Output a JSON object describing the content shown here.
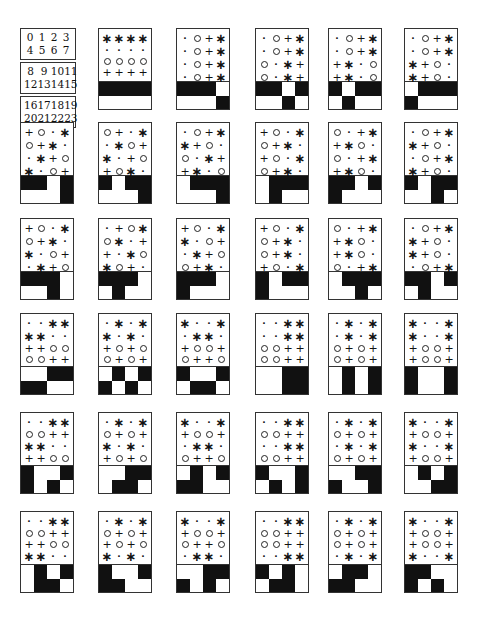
{
  "key": {
    "groups": [
      [
        "0",
        "1",
        "2",
        "3",
        "4",
        "5",
        "6",
        "7"
      ],
      [
        "8",
        "9",
        "10",
        "11",
        "12",
        "13",
        "14",
        "15"
      ],
      [
        "16",
        "17",
        "18",
        "19",
        "20",
        "21",
        "22",
        "23"
      ]
    ]
  },
  "legend": {
    "symbols": {
      "*": "asterisk",
      ".": "dot",
      "o": "circle",
      "+": "plus"
    },
    "bars": {
      "1": "black",
      "0": "white"
    }
  },
  "panels": [
    {
      "row": 0,
      "col": 1,
      "grid": [
        "****",
        "....",
        "oooo",
        "++++"
      ],
      "bars": [
        "1111",
        "0000"
      ]
    },
    {
      "row": 0,
      "col": 2,
      "grid": [
        ".o+*",
        ".o+*",
        ".o+*",
        ".o+*"
      ],
      "bars": [
        "1110",
        "0001"
      ]
    },
    {
      "row": 0,
      "col": 3,
      "grid": [
        ".o+*",
        ".o+*",
        "o.*+",
        "o.*+"
      ],
      "bars": [
        "1101",
        "0010"
      ]
    },
    {
      "row": 0,
      "col": 4,
      "grid": [
        ".o+*",
        ".o+*",
        "+*.o",
        "+*.o"
      ],
      "bars": [
        "1011",
        "0100"
      ]
    },
    {
      "row": 0,
      "col": 5,
      "grid": [
        ".o+*",
        ".o+*",
        "*+o.",
        "*+o."
      ],
      "bars": [
        "0111",
        "1000"
      ]
    },
    {
      "row": 1,
      "col": 0,
      "grid": [
        "+o.*",
        "o+*.",
        ".*+o",
        "*.o+"
      ],
      "bars": [
        "1101",
        "0001"
      ]
    },
    {
      "row": 1,
      "col": 1,
      "grid": [
        "o+.*",
        ".*o+",
        "*.+o",
        "+o*."
      ],
      "bars": [
        "1011",
        "0001"
      ]
    },
    {
      "row": 1,
      "col": 2,
      "grid": [
        ".o+*",
        "*+o.",
        "o.*+",
        "+*.o"
      ],
      "bars": [
        "0111",
        "0001"
      ]
    },
    {
      "row": 1,
      "col": 3,
      "grid": [
        "+o.*",
        "o+*.",
        "+o.*",
        "o+*."
      ],
      "bars": [
        "0111",
        "0100"
      ]
    },
    {
      "row": 1,
      "col": 4,
      "grid": [
        "o.+*",
        "+*o.",
        "o.+*",
        "+*o."
      ],
      "bars": [
        "1101",
        "1000"
      ]
    },
    {
      "row": 1,
      "col": 5,
      "grid": [
        ".o+*",
        "*+o.",
        ".o+*",
        "*+o."
      ],
      "bars": [
        "1011",
        "0010"
      ]
    },
    {
      "row": 2,
      "col": 0,
      "grid": [
        "+o.*",
        "o+*.",
        "*.o+",
        ".*+o"
      ],
      "bars": [
        "1110",
        "0010"
      ]
    },
    {
      "row": 2,
      "col": 1,
      "grid": [
        ".+o*",
        "o*.+",
        "+.*o",
        "*o+."
      ],
      "bars": [
        "1110",
        "0100"
      ]
    },
    {
      "row": 2,
      "col": 2,
      "grid": [
        "+o.*",
        "*.o+",
        ".*+o",
        "o+*."
      ],
      "bars": [
        "1110",
        "1000"
      ]
    },
    {
      "row": 2,
      "col": 3,
      "grid": [
        "+o.*",
        "o+*.",
        "o+*.",
        "+o.*"
      ],
      "bars": [
        "1011",
        "1000"
      ]
    },
    {
      "row": 2,
      "col": 4,
      "grid": [
        "o.+*",
        "+*o.",
        "+*o.",
        "o.+*"
      ],
      "bars": [
        "0111",
        "0010"
      ]
    },
    {
      "row": 2,
      "col": 5,
      "grid": [
        ".o+*",
        "*+o.",
        "*+o.",
        ".o+*"
      ],
      "bars": [
        "1101",
        "0100"
      ]
    },
    {
      "row": 3,
      "col": 0,
      "grid": [
        "..**",
        "**..",
        "++oo",
        "oo++"
      ],
      "bars": [
        "0011",
        "1100"
      ]
    },
    {
      "row": 3,
      "col": 1,
      "grid": [
        ".*.*",
        "*.*.",
        "+o+o",
        "o+o+"
      ],
      "bars": [
        "0101",
        "1010"
      ]
    },
    {
      "row": 3,
      "col": 2,
      "grid": [
        "*..*",
        ".**.",
        "+oo+",
        "o++o"
      ],
      "bars": [
        "1001",
        "0110"
      ]
    },
    {
      "row": 3,
      "col": 3,
      "grid": [
        "..**",
        "..**",
        "oo++",
        "oo++"
      ],
      "bars": [
        "0011",
        "0011"
      ]
    },
    {
      "row": 3,
      "col": 4,
      "grid": [
        ".*.*",
        ".*.*",
        "o+o+",
        "o+o+"
      ],
      "bars": [
        "0101",
        "0101"
      ]
    },
    {
      "row": 3,
      "col": 5,
      "grid": [
        "*..*",
        "*..*",
        "+oo+",
        "+oo+"
      ],
      "bars": [
        "1001",
        "1001"
      ]
    },
    {
      "row": 4,
      "col": 0,
      "grid": [
        "..**",
        "oo++",
        "**..",
        "++oo"
      ],
      "bars": [
        "1001",
        "1010"
      ]
    },
    {
      "row": 4,
      "col": 1,
      "grid": [
        ".*.*",
        "o+o+",
        "*.*.",
        "+o+o"
      ],
      "bars": [
        "0011",
        "0110"
      ]
    },
    {
      "row": 4,
      "col": 2,
      "grid": [
        "*..*",
        "+oo+",
        ".**.",
        "o++o"
      ],
      "bars": [
        "0101",
        "1100"
      ]
    },
    {
      "row": 4,
      "col": 3,
      "grid": [
        "..**",
        "oo++",
        "..**",
        "oo++"
      ],
      "bars": [
        "1001",
        "0101"
      ]
    },
    {
      "row": 4,
      "col": 4,
      "grid": [
        ".*.*",
        "o+o+",
        ".*.*",
        "o+o+"
      ],
      "bars": [
        "0011",
        "1001"
      ]
    },
    {
      "row": 4,
      "col": 5,
      "grid": [
        "*..*",
        "+oo+",
        "*..*",
        "+oo+"
      ],
      "bars": [
        "0101",
        "0011"
      ]
    },
    {
      "row": 5,
      "col": 0,
      "grid": [
        "..**",
        "oo++",
        "++oo",
        "**.."
      ],
      "bars": [
        "0101",
        "0110"
      ]
    },
    {
      "row": 5,
      "col": 1,
      "grid": [
        ".*.*",
        "o+o+",
        "+o+o",
        "*.*."
      ],
      "bars": [
        "1001",
        "1100"
      ]
    },
    {
      "row": 5,
      "col": 2,
      "grid": [
        "*..*",
        "+oo+",
        "o++o",
        ".**."
      ],
      "bars": [
        "0011",
        "1010"
      ]
    },
    {
      "row": 5,
      "col": 3,
      "grid": [
        "..**",
        "oo++",
        "oo++",
        "..**"
      ],
      "bars": [
        "1010",
        "0110"
      ]
    },
    {
      "row": 5,
      "col": 4,
      "grid": [
        ".*.*",
        "o+o+",
        "o+o+",
        ".*.*"
      ],
      "bars": [
        "0110",
        "1100"
      ]
    },
    {
      "row": 5,
      "col": 5,
      "grid": [
        "*..*",
        "+oo+",
        "+oo+",
        "*..*"
      ],
      "bars": [
        "1100",
        "1010"
      ]
    }
  ]
}
